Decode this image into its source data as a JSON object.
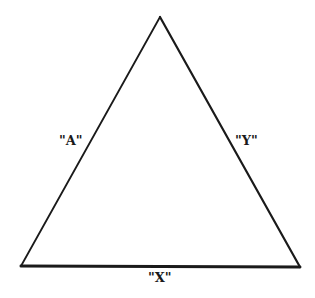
{
  "diagram": {
    "type": "triangle",
    "vertices": {
      "apex": [
        160,
        17
      ],
      "bottom_left": [
        21,
        266
      ],
      "bottom_right": [
        300,
        267
      ]
    },
    "sides": [
      {
        "id": "left",
        "label": "\"A\""
      },
      {
        "id": "right",
        "label": "\"Y\""
      },
      {
        "id": "base",
        "label": "\"X\""
      }
    ],
    "stroke_color": "#1a1a1a",
    "background": "#ffffff"
  }
}
